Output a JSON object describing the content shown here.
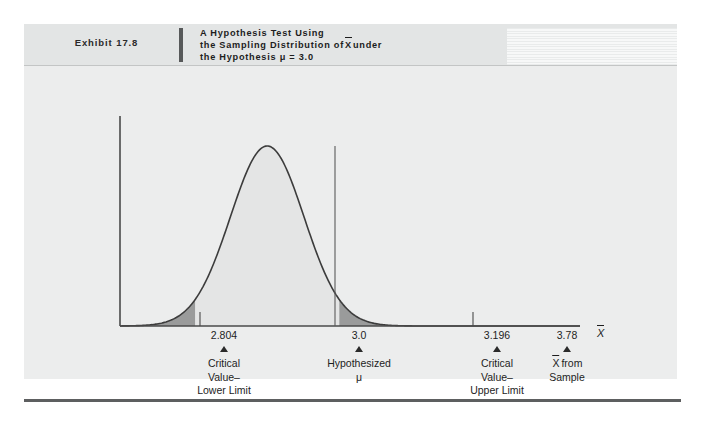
{
  "exhibit": {
    "label": "Exhibit 17.8",
    "title_line1": "A Hypothesis Test Using",
    "title_line2_a": "the Sampling Distribution of",
    "title_line2_x": "X",
    "title_line2_b": "under",
    "title_line3": "the Hypothesis μ = 3.0"
  },
  "colors": {
    "panel_background": "#eceded",
    "header_background": "#e3e5e5",
    "curve_stroke": "#3c3c3c",
    "curve_fill": "#e4e5e5",
    "tail_fill": "#9a9b9b",
    "axis": "#4a4a4a",
    "text": "#1d1d1d",
    "bottom_rule": "#5d5f60"
  },
  "axis_label": "X",
  "annotations": [
    {
      "value": "2.804",
      "caption_line1": "Critical",
      "caption_line2": "Value–",
      "caption_line3": "Lower Limit",
      "x_px": 200
    },
    {
      "value": "3.0",
      "caption_line1": "Hypothesized",
      "caption_line2": "μ",
      "caption_line3": "",
      "x_px": 335
    },
    {
      "value": "3.196",
      "caption_line1": "Critical",
      "caption_line2": "Value–",
      "caption_line3": "Upper Limit",
      "x_px": 473
    },
    {
      "value": "3.78",
      "caption_line1": "X from",
      "caption_line2": "Sample",
      "caption_line3": "",
      "x_px": 543
    }
  ],
  "chart_data": {
    "type": "line",
    "xlabel": "X̄",
    "ylabel": "",
    "grid": false,
    "legend": "none",
    "distribution": "normal",
    "mean": 3.0,
    "std_dev": 0.1,
    "xlim": [
      2.6,
      3.85
    ],
    "ylim": [
      0,
      1
    ],
    "curve_x": [
      2.6,
      2.65,
      2.7,
      2.75,
      2.804,
      2.85,
      2.9,
      2.95,
      3.0,
      3.05,
      3.1,
      3.15,
      3.196,
      3.25,
      3.3,
      3.35,
      3.4,
      3.5,
      3.6,
      3.78
    ],
    "curve_y": [
      0.0,
      0.001,
      0.011,
      0.066,
      0.144,
      0.325,
      0.607,
      0.882,
      1.0,
      0.882,
      0.607,
      0.325,
      0.144,
      0.044,
      0.011,
      0.002,
      0.0,
      0.0,
      0.0,
      0.0
    ],
    "critical_values": [
      2.804,
      3.196
    ],
    "hypothesized_mean": 3.0,
    "sample_mean": 3.78,
    "shaded_regions": [
      {
        "name": "lower-rejection-region",
        "from": 2.6,
        "to": 2.804,
        "fill": "#9a9b9b"
      },
      {
        "name": "acceptance-region",
        "from": 2.804,
        "to": 3.196,
        "fill": "#e4e5e5"
      },
      {
        "name": "upper-rejection-region",
        "from": 3.196,
        "to": 3.78,
        "fill": "#9a9b9b"
      }
    ],
    "tick_labels": [
      "2.804",
      "3.0",
      "3.196",
      "3.78"
    ]
  }
}
